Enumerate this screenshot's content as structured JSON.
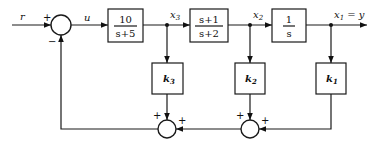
{
  "diagram": {
    "type": "state-feedback block diagram",
    "signals": {
      "input": "r",
      "control": "u",
      "state3": "x",
      "state3_sub": "3",
      "state2": "x",
      "state2_sub": "2",
      "output_x": "x",
      "output_sub": "1",
      "output_eq": " = y"
    },
    "blocks": [
      {
        "id": "plant1",
        "numerator": "10",
        "denominator": "s+5"
      },
      {
        "id": "plant2",
        "numerator": "s+1",
        "denominator": "s+2"
      },
      {
        "id": "integrator",
        "numerator": "1",
        "denominator": "s"
      }
    ],
    "gains": [
      {
        "id": "k3",
        "symbol": "k",
        "sub": "3"
      },
      {
        "id": "k2",
        "symbol": "k",
        "sub": "2"
      },
      {
        "id": "k1",
        "symbol": "k",
        "sub": "1"
      }
    ],
    "summing_junctions": [
      {
        "id": "sum-main",
        "signs": {
          "left": "+",
          "bottom": "−"
        }
      },
      {
        "id": "sum-k3",
        "signs": {
          "top": "+",
          "right": "+"
        }
      },
      {
        "id": "sum-k2",
        "signs": {
          "top": "+",
          "right": "+"
        }
      }
    ],
    "colors": {
      "line": "#1a1a1a",
      "background": "#ffffff"
    }
  }
}
